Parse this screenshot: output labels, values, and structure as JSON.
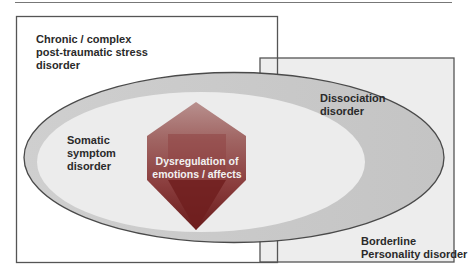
{
  "figure": {
    "type": "venn-style overlap diagram",
    "regions": {
      "ptsd": {
        "line1": "Chronic / complex",
        "line2": "post-traumatic stress",
        "line3": "disorder"
      },
      "dissociation": {
        "line1": "Dissociation",
        "line2": "disorder"
      },
      "somatic": {
        "line1": "Somatic",
        "line2": "symptom",
        "line3": "disorder"
      },
      "core": {
        "line1": "Dysregulation of",
        "line2": "emotions / affects"
      },
      "borderline": {
        "line1": "Borderline",
        "line2": "Personality disorder"
      }
    },
    "colors": {
      "box_stroke": "#555555",
      "right_box_fill": "#ededed",
      "outer_ellipse_fill": "#c9c9c9",
      "inner_ellipse_fill": "#ececec",
      "ellipse_stroke": "#4a4a4a",
      "core_top": "#b07a78",
      "core_mid": "#8e4848",
      "core_bottom": "#6e2020"
    }
  }
}
